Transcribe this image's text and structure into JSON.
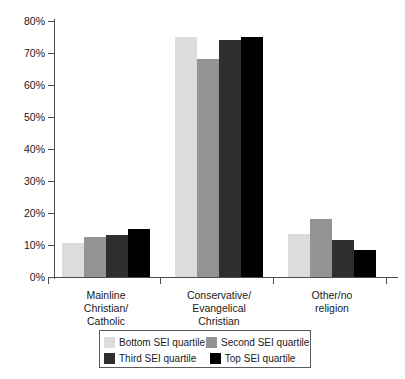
{
  "chart_data": {
    "type": "bar",
    "title": "",
    "subtitle": "",
    "xlabel": "",
    "ylabel": "",
    "ylim": [
      0,
      80
    ],
    "ytick_labels": [
      "0%",
      "10%",
      "20%",
      "30%",
      "40%",
      "50%",
      "60%",
      "70%",
      "80%"
    ],
    "ytick_values": [
      0,
      10,
      20,
      30,
      40,
      50,
      60,
      70,
      80
    ],
    "grid": false,
    "legend_position": "bottom",
    "value_unit": "%",
    "categories": [
      "Mainline\nChristian/\nCatholic",
      "Conservative/\nEvangelical\nChristian",
      "Other/no\nreligion"
    ],
    "series": [
      {
        "name": "Bottom SEI quartile",
        "color": "#dcdcdc",
        "values": [
          10.5,
          75,
          13.5
        ]
      },
      {
        "name": "Second SEI quartile",
        "color": "#949494",
        "values": [
          12.5,
          68,
          18
        ]
      },
      {
        "name": "Third SEI quartile",
        "color": "#2e2e2e",
        "values": [
          13,
          74,
          11.5
        ]
      },
      {
        "name": "Top SEI quartile",
        "color": "#000000",
        "values": [
          15,
          75,
          8.5
        ]
      }
    ]
  },
  "axis": {
    "y_ticks": [
      {
        "label": "80%",
        "value": 80
      },
      {
        "label": "70%",
        "value": 70
      },
      {
        "label": "60%",
        "value": 60
      },
      {
        "label": "50%",
        "value": 50
      },
      {
        "label": "40%",
        "value": 40
      },
      {
        "label": "30%",
        "value": 30
      },
      {
        "label": "20%",
        "value": 20
      },
      {
        "label": "10%",
        "value": 10
      },
      {
        "label": "0%",
        "value": 0
      }
    ]
  },
  "legend": {
    "rows": [
      [
        {
          "label": "Bottom SEI quartile",
          "color": "#dcdcdc"
        },
        {
          "label": "Second SEI quartile",
          "color": "#949494"
        }
      ],
      [
        {
          "label": "Third SEI quartile",
          "color": "#2e2e2e"
        },
        {
          "label": "Top SEI quartile",
          "color": "#000000"
        }
      ]
    ]
  }
}
